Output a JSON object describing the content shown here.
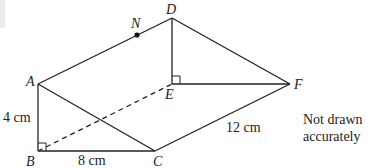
{
  "figure": {
    "shape": "triangular prism",
    "vertices": {
      "A": "A",
      "B": "B",
      "C": "C",
      "D": "D",
      "E": "E",
      "F": "F",
      "N": "N"
    },
    "edges": {
      "visible": [
        "AB",
        "BC",
        "AC",
        "AD",
        "DE",
        "DF",
        "EF",
        "CF"
      ],
      "hidden": [
        "BE"
      ]
    },
    "right_angles": [
      "ABC",
      "DEF"
    ],
    "point_on_edge": {
      "point": "N",
      "edge": "AD"
    },
    "measurements": {
      "AB": "4 cm",
      "BC": "8 cm",
      "CF": "12 cm"
    },
    "note_line1": "Not drawn",
    "note_line2": "accurately"
  }
}
